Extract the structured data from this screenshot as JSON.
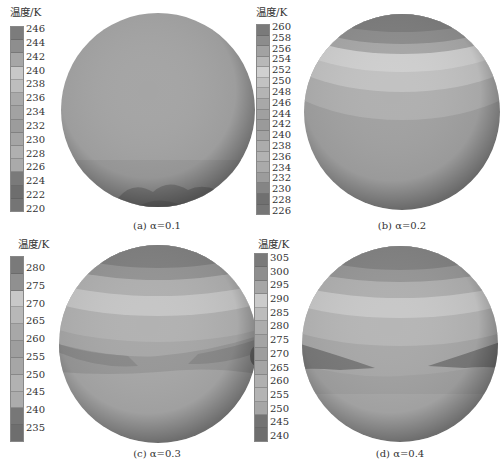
{
  "figure": {
    "colorbar_title": "温度/K",
    "panels": [
      {
        "id": "a",
        "caption": "(a) α=0.1",
        "alpha": 0.1,
        "ticks": [
          "246",
          "244",
          "242",
          "240",
          "238",
          "236",
          "234",
          "232",
          "230",
          "228",
          "226",
          "224",
          "222",
          "220"
        ],
        "swatches": [
          "#7c7c7c",
          "#8e8e8e",
          "#a6a6a6",
          "#c8c8c8",
          "#bdbdbd",
          "#a9a9a9",
          "#a2a2a2",
          "#9c9c9c",
          "#a5a5a5",
          "#b0b0b0",
          "#aaaaaa",
          "#7a7a7a",
          "#6e6e6e",
          "#757575"
        ]
      },
      {
        "id": "b",
        "caption": "(b) α=0.2",
        "alpha": 0.2,
        "ticks": [
          "260",
          "258",
          "256",
          "254",
          "252",
          "250",
          "248",
          "246",
          "244",
          "242",
          "240",
          "238",
          "236",
          "234",
          "232",
          "230",
          "228",
          "226"
        ],
        "swatches": [
          "#7a7a7a",
          "#8c8c8c",
          "#a2a2a2",
          "#b8b8b8",
          "#d0d0d0",
          "#c2c2c2",
          "#b4b4b4",
          "#a8a8a8",
          "#a0a0a0",
          "#9a9a9a",
          "#a2a2a2",
          "#acacac",
          "#b2b2b2",
          "#aaaaaa",
          "#9c9c9c",
          "#858585",
          "#707070",
          "#767676"
        ]
      },
      {
        "id": "c",
        "caption": "(c) α=0.3",
        "alpha": 0.3,
        "ticks": [
          "280",
          "275",
          "270",
          "265",
          "260",
          "255",
          "250",
          "245",
          "240",
          "235"
        ],
        "swatches": [
          "#7a7a7a",
          "#909090",
          "#c8c8c8",
          "#b8b8b8",
          "#a8a8a8",
          "#9e9e9e",
          "#a6a6a6",
          "#b2b2b2",
          "#acacac",
          "#777777",
          "#6e6e6e"
        ]
      },
      {
        "id": "d",
        "caption": "(d) α=0.4",
        "alpha": 0.4,
        "ticks": [
          "305",
          "300",
          "295",
          "290",
          "285",
          "280",
          "275",
          "270",
          "265",
          "260",
          "255",
          "250",
          "245",
          "240"
        ],
        "swatches": [
          "#7a7a7a",
          "#8e8e8e",
          "#a6a6a6",
          "#cbcbcb",
          "#bcbcbc",
          "#adadad",
          "#a4a4a4",
          "#9e9e9e",
          "#a5a5a5",
          "#b0b0b0",
          "#b4b4b4",
          "#a6a6a6",
          "#737373",
          "#6e6e6e"
        ]
      }
    ]
  },
  "chart_data": [
    {
      "type": "heatmap",
      "title": "(a) α=0.1",
      "legend_title": "温度/K",
      "colorbar_ticks": [
        246,
        244,
        242,
        240,
        238,
        236,
        234,
        232,
        230,
        228,
        226,
        224,
        222,
        220
      ],
      "range": [
        220,
        246
      ],
      "description": "Nearly uniform sphere; darker cold region (~222-224 K) at bottom pole"
    },
    {
      "type": "heatmap",
      "title": "(b) α=0.2",
      "legend_title": "温度/K",
      "colorbar_ticks": [
        260,
        258,
        256,
        254,
        252,
        250,
        248,
        246,
        244,
        242,
        240,
        238,
        236,
        234,
        232,
        230,
        228,
        226
      ],
      "range": [
        226,
        260
      ],
      "description": "Latitudinal bands; dark cap at top, bright band just below top (~252-254 K), gradually darker toward bottom"
    },
    {
      "type": "heatmap",
      "title": "(c) α=0.3",
      "legend_title": "温度/K",
      "colorbar_ticks": [
        280,
        275,
        270,
        265,
        260,
        255,
        250,
        245,
        240,
        235
      ],
      "range": [
        235,
        280
      ],
      "description": "Latitudinal bands; dark top cap, bright band near upper latitudes (~270 K), darker band around equator slightly below middle"
    },
    {
      "type": "heatmap",
      "title": "(d) α=0.4",
      "legend_title": "温度/K",
      "colorbar_ticks": [
        305,
        300,
        295,
        290,
        285,
        280,
        275,
        270,
        265,
        260,
        255,
        250,
        245,
        240
      ],
      "range": [
        240,
        305
      ],
      "description": "Latitudinal bands; dark top cap, bright band near upper latitudes (~290-295 K), dark wedges on left and right near equator (~245-250 K)"
    }
  ]
}
